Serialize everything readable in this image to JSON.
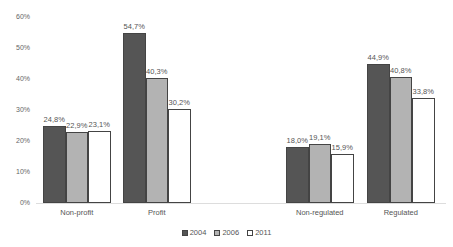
{
  "chart_data": {
    "type": "bar",
    "title": "",
    "xlabel": "",
    "ylabel": "",
    "ylim": [
      0,
      60
    ],
    "yticks": [
      "0%",
      "10%",
      "20%",
      "30%",
      "40%",
      "50%",
      "60%"
    ],
    "categories": [
      "Non-profit",
      "Profit",
      "Non-regulated",
      "Regulated"
    ],
    "series": [
      {
        "name": "2004",
        "color": "#555555",
        "values": [
          24.8,
          54.7,
          18.0,
          44.9
        ],
        "labels": [
          "24,8%",
          "54,7%",
          "18,0%",
          "44,9%"
        ]
      },
      {
        "name": "2006",
        "color": "#b3b3b3",
        "values": [
          22.9,
          40.3,
          19.1,
          40.8
        ],
        "labels": [
          "22,9%",
          "40,3%",
          "19,1%",
          "40,8%"
        ]
      },
      {
        "name": "2011",
        "color": "#ffffff",
        "values": [
          23.1,
          30.2,
          15.9,
          33.8
        ],
        "labels": [
          "23,1%",
          "30,2%",
          "15,9%",
          "33,8%"
        ]
      }
    ],
    "legend_position": "bottom",
    "grid": false
  },
  "legend": {
    "items": [
      "2004",
      "2006",
      "2011"
    ]
  }
}
